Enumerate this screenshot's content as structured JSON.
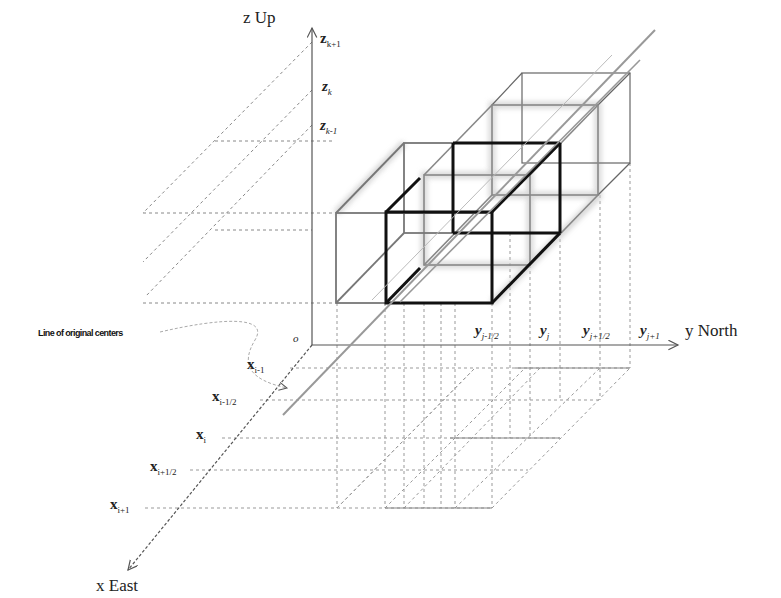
{
  "diagram": {
    "axes": {
      "z": {
        "label": "z Up"
      },
      "y": {
        "label": "y North"
      },
      "x": {
        "label": "x East"
      },
      "origin": {
        "label": "o"
      }
    },
    "z_ticks": [
      {
        "base": "z",
        "sub": "k+1"
      },
      {
        "base": "z",
        "sub": "k"
      },
      {
        "base": "z",
        "sub": "k-1"
      }
    ],
    "y_ticks": [
      {
        "base": "y",
        "sub": "j-1/2"
      },
      {
        "base": "y",
        "sub": "j"
      },
      {
        "base": "y",
        "sub": "j+1/2"
      },
      {
        "base": "y",
        "sub": "j+1"
      }
    ],
    "x_ticks": [
      {
        "base": "x",
        "sub": "i-1"
      },
      {
        "base": "x",
        "sub": "i-1/2"
      },
      {
        "base": "x",
        "sub": "i"
      },
      {
        "base": "x",
        "sub": "i+1/2"
      },
      {
        "base": "x",
        "sub": "i+1"
      }
    ],
    "annotation": "Line of original centers",
    "colors": {
      "axis": "#555555",
      "grid": "#888888",
      "cell_gray": "#777777",
      "cell_black": "#111111",
      "glow": "#bbbbbb"
    }
  }
}
